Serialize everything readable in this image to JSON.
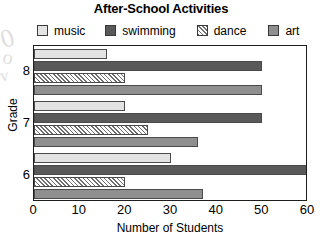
{
  "chart_data": {
    "type": "bar",
    "orientation": "horizontal",
    "title": "After-School Activities",
    "xlabel": "Number of Students",
    "ylabel": "Grade",
    "categories": [
      "8",
      "7",
      "6"
    ],
    "series": [
      {
        "name": "music",
        "color": "#e3e3e3",
        "pattern": "solid",
        "values": [
          16,
          20,
          30
        ]
      },
      {
        "name": "swimming",
        "color": "#595959",
        "pattern": "solid",
        "values": [
          50,
          50,
          60
        ]
      },
      {
        "name": "dance",
        "color": "#ffffff",
        "pattern": "hatch",
        "values": [
          20,
          25,
          20
        ]
      },
      {
        "name": "art",
        "color": "#8f8f8f",
        "pattern": "solid",
        "values": [
          50,
          36,
          37
        ]
      }
    ],
    "xlim": [
      0,
      60
    ],
    "xticks": [
      0,
      10,
      20,
      30,
      40,
      50,
      60
    ],
    "xtick_labels": [
      "0",
      "10",
      "20",
      "30",
      "40",
      "50",
      "60"
    ],
    "ytick_labels": [
      "8",
      "7",
      "6"
    ],
    "grid": false,
    "legend_position": "top",
    "legend_entries": [
      "music",
      "swimming",
      "dance",
      "art"
    ]
  },
  "artifacts": {
    "smudge_1": "0",
    "smudge_2": "o",
    "smudge_3": "v"
  }
}
